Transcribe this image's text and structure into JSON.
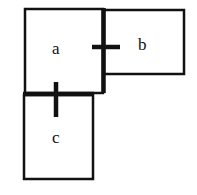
{
  "diagram": {
    "boxes": [
      {
        "id": "a",
        "label": "a"
      },
      {
        "id": "b",
        "label": "b"
      },
      {
        "id": "c",
        "label": "c"
      }
    ],
    "connections": [
      {
        "from": "a",
        "to": "b",
        "type": "shared-edge-with-cross"
      },
      {
        "from": "a",
        "to": "c",
        "type": "shared-edge-with-cross"
      }
    ],
    "colors": {
      "stroke": "#111111",
      "background": "#ffffff"
    }
  }
}
